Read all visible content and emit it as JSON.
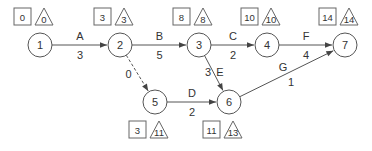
{
  "diagram": {
    "type": "activity-on-arrow network",
    "colors": {
      "stroke": "#555555",
      "text": "#333333",
      "background": "#ffffff"
    },
    "nodes": [
      {
        "id": "1",
        "label": "1",
        "x": 40,
        "y": 45,
        "early": "0",
        "late": "0",
        "box_pos": "above"
      },
      {
        "id": "2",
        "label": "2",
        "x": 120,
        "y": 45,
        "early": "3",
        "late": "3",
        "box_pos": "above"
      },
      {
        "id": "3",
        "label": "3",
        "x": 199,
        "y": 45,
        "early": "8",
        "late": "8",
        "box_pos": "above"
      },
      {
        "id": "4",
        "label": "4",
        "x": 267,
        "y": 45,
        "early": "10",
        "late": "10",
        "box_pos": "above"
      },
      {
        "id": "7",
        "label": "7",
        "x": 345,
        "y": 45,
        "early": "14",
        "late": "14",
        "box_pos": "above"
      },
      {
        "id": "5",
        "label": "5",
        "x": 155,
        "y": 102,
        "early": "3",
        "late": "11",
        "box_pos": "below"
      },
      {
        "id": "6",
        "label": "6",
        "x": 229,
        "y": 102,
        "early": "11",
        "late": "13",
        "box_pos": "below"
      }
    ],
    "edges": [
      {
        "from": "1",
        "to": "2",
        "activity": "A",
        "duration": "3",
        "dashed": false
      },
      {
        "from": "2",
        "to": "3",
        "activity": "B",
        "duration": "5",
        "dashed": false
      },
      {
        "from": "3",
        "to": "4",
        "activity": "C",
        "duration": "2",
        "dashed": false
      },
      {
        "from": "4",
        "to": "7",
        "activity": "F",
        "duration": "4",
        "dashed": false
      },
      {
        "from": "2",
        "to": "5",
        "activity": "",
        "duration": "0",
        "dashed": true
      },
      {
        "from": "5",
        "to": "6",
        "activity": "D",
        "duration": "2",
        "dashed": false
      },
      {
        "from": "3",
        "to": "6",
        "activity": "E",
        "duration": "3",
        "dashed": false
      },
      {
        "from": "6",
        "to": "7",
        "activity": "G",
        "duration": "1",
        "dashed": false
      }
    ]
  }
}
